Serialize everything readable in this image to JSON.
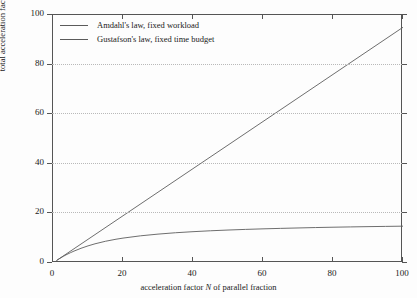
{
  "chart_data": {
    "type": "line",
    "title": "",
    "xlabel": "acceleration factor N of parallel fraction",
    "xlabel_parts": {
      "pre": "acceleration factor ",
      "italic": "N",
      "post": " of parallel fraction"
    },
    "ylabel": "total acceleration factor a",
    "ylabel_parts": {
      "pre": "total acceleration factor ",
      "italic": "a",
      "post": ""
    },
    "xlim": [
      0,
      100
    ],
    "ylim": [
      0,
      100
    ],
    "xticks": [
      0,
      20,
      40,
      60,
      80,
      100
    ],
    "yticks": [
      0,
      20,
      40,
      60,
      80,
      100
    ],
    "xtick_labels": [
      "0",
      "20",
      "40",
      "60",
      "80",
      "100"
    ],
    "ytick_labels": [
      "0",
      "20",
      "40",
      "60",
      "80",
      "100"
    ],
    "grid": "horizontal-dotted",
    "gridlines_y": [
      20,
      40,
      60,
      80
    ],
    "legend_position": "top-left-inside",
    "parallel_fraction": 0.95,
    "series": [
      {
        "name": "Amdahl's law, fixed workload",
        "color": "#5d5d5d",
        "x": [
          1,
          2,
          3,
          4,
          5,
          6,
          8,
          10,
          12,
          15,
          18,
          20,
          25,
          30,
          35,
          40,
          45,
          50,
          55,
          60,
          65,
          70,
          75,
          80,
          85,
          90,
          95,
          100
        ],
        "values": [
          1.0,
          1.9,
          2.73,
          3.48,
          4.17,
          4.8,
          5.93,
          6.9,
          7.74,
          8.77,
          9.59,
          10.04,
          10.96,
          11.65,
          12.2,
          12.63,
          12.99,
          13.29,
          13.55,
          13.77,
          13.96,
          14.13,
          14.29,
          14.43,
          14.55,
          14.66,
          14.76,
          14.85
        ]
      },
      {
        "name": "Gustafson's law, fixed time budget",
        "color": "#5d5d5d",
        "x": [
          1,
          10,
          20,
          30,
          40,
          50,
          60,
          70,
          80,
          90,
          100
        ],
        "values": [
          1.0,
          9.55,
          19.05,
          28.55,
          38.05,
          47.55,
          57.05,
          66.55,
          76.05,
          85.55,
          95.05
        ]
      }
    ]
  },
  "legend": {
    "items": [
      {
        "label": "Amdahl's law, fixed workload"
      },
      {
        "label": "Gustafson's law, fixed time budget"
      }
    ]
  }
}
